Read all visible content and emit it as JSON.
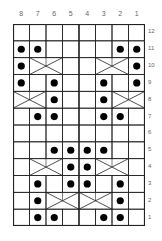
{
  "chart_title": "",
  "columns": [
    "8",
    "7",
    "6",
    "5",
    "4",
    "3",
    "2",
    "1"
  ],
  "rows": [
    "12",
    "11",
    "10",
    "9",
    "8",
    "7",
    "6",
    "5",
    "4",
    "3",
    "2",
    "1"
  ],
  "colors": {
    "line": "#222222",
    "dot": "#000000",
    "label": "#666666",
    "background": "#ffffff"
  },
  "cells": {
    "12": {
      "dots": [],
      "cables": []
    },
    "11": {
      "dots": [
        8,
        7,
        2,
        1
      ],
      "cables": []
    },
    "10": {
      "dots": [
        8,
        1
      ],
      "cables": [
        [
          7,
          6
        ],
        [
          3,
          2
        ]
      ]
    },
    "9": {
      "dots": [
        8,
        6,
        3,
        1
      ],
      "cables": []
    },
    "8": {
      "dots": [
        6,
        3
      ],
      "cables": [
        [
          8,
          7
        ],
        [
          2,
          1
        ]
      ]
    },
    "7": {
      "dots": [
        7,
        6,
        3,
        2
      ],
      "cables": []
    },
    "6": {
      "dots": [],
      "cables": []
    },
    "5": {
      "dots": [
        6,
        5,
        4,
        3
      ],
      "cables": []
    },
    "4": {
      "dots": [
        5,
        4
      ],
      "cables": [
        [
          7,
          6
        ],
        [
          3,
          2
        ]
      ]
    },
    "3": {
      "dots": [
        7,
        5,
        4,
        2
      ],
      "cables": []
    },
    "2": {
      "dots": [
        7,
        2
      ],
      "cables": [
        [
          6,
          5
        ],
        [
          4,
          3
        ]
      ]
    },
    "1": {
      "dots": [
        7,
        6,
        3,
        2
      ],
      "cables": []
    }
  }
}
